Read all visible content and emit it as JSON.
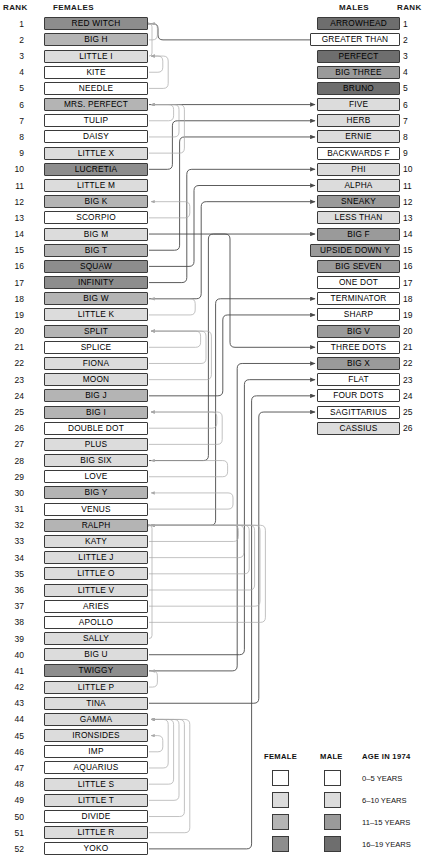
{
  "headers": {
    "rank_left": "RANK",
    "females": "FEMALES",
    "males": "MALES",
    "rank_right": "RANK"
  },
  "females": [
    {
      "rank": 1,
      "name": "RED WITCH",
      "age_class": 3
    },
    {
      "rank": 2,
      "name": "BIG H",
      "age_class": 2
    },
    {
      "rank": 3,
      "name": "LITTLE I",
      "age_class": 1
    },
    {
      "rank": 4,
      "name": "KITE",
      "age_class": 0
    },
    {
      "rank": 5,
      "name": "NEEDLE",
      "age_class": 0
    },
    {
      "rank": 6,
      "name": "MRS. PERFECT",
      "age_class": 2
    },
    {
      "rank": 7,
      "name": "TULIP",
      "age_class": 0
    },
    {
      "rank": 8,
      "name": "DAISY",
      "age_class": 0
    },
    {
      "rank": 9,
      "name": "LITTLE X",
      "age_class": 1
    },
    {
      "rank": 10,
      "name": "LUCRETIA",
      "age_class": 3
    },
    {
      "rank": 11,
      "name": "LITTLE M",
      "age_class": 1
    },
    {
      "rank": 12,
      "name": "BIG K",
      "age_class": 2
    },
    {
      "rank": 13,
      "name": "SCORPIO",
      "age_class": 0
    },
    {
      "rank": 14,
      "name": "BIG M",
      "age_class": 1
    },
    {
      "rank": 15,
      "name": "BIG T",
      "age_class": 2
    },
    {
      "rank": 16,
      "name": "SQUAW",
      "age_class": 3
    },
    {
      "rank": 17,
      "name": "INFINITY",
      "age_class": 3
    },
    {
      "rank": 18,
      "name": "BIG W",
      "age_class": 2
    },
    {
      "rank": 19,
      "name": "LITTLE K",
      "age_class": 1
    },
    {
      "rank": 20,
      "name": "SPLIT",
      "age_class": 2
    },
    {
      "rank": 21,
      "name": "SPLICE",
      "age_class": 0
    },
    {
      "rank": 22,
      "name": "FIONA",
      "age_class": 1
    },
    {
      "rank": 23,
      "name": "MOON",
      "age_class": 1
    },
    {
      "rank": 24,
      "name": "BIG J",
      "age_class": 2
    },
    {
      "rank": 25,
      "name": "BIG I",
      "age_class": 2
    },
    {
      "rank": 26,
      "name": "DOUBLE DOT",
      "age_class": 0
    },
    {
      "rank": 27,
      "name": "PLUS",
      "age_class": 1
    },
    {
      "rank": 28,
      "name": "BIG SIX",
      "age_class": 1
    },
    {
      "rank": 29,
      "name": "LOVE",
      "age_class": 0
    },
    {
      "rank": 30,
      "name": "BIG Y",
      "age_class": 2
    },
    {
      "rank": 31,
      "name": "VENUS",
      "age_class": 0
    },
    {
      "rank": 32,
      "name": "RALPH",
      "age_class": 2
    },
    {
      "rank": 33,
      "name": "KATY",
      "age_class": 1
    },
    {
      "rank": 34,
      "name": "LITTLE J",
      "age_class": 1
    },
    {
      "rank": 35,
      "name": "LITTLE O",
      "age_class": 1
    },
    {
      "rank": 36,
      "name": "LITTLE V",
      "age_class": 1
    },
    {
      "rank": 37,
      "name": "ARIES",
      "age_class": 0
    },
    {
      "rank": 38,
      "name": "APOLLO",
      "age_class": 0
    },
    {
      "rank": 39,
      "name": "SALLY",
      "age_class": 1
    },
    {
      "rank": 40,
      "name": "BIG U",
      "age_class": 1
    },
    {
      "rank": 41,
      "name": "TWIGGY",
      "age_class": 3
    },
    {
      "rank": 42,
      "name": "LITTLE P",
      "age_class": 1
    },
    {
      "rank": 43,
      "name": "TINA",
      "age_class": 1
    },
    {
      "rank": 44,
      "name": "GAMMA",
      "age_class": 1
    },
    {
      "rank": 45,
      "name": "IRONSIDES",
      "age_class": 1
    },
    {
      "rank": 46,
      "name": "IMP",
      "age_class": 0
    },
    {
      "rank": 47,
      "name": "AQUARIUS",
      "age_class": 0
    },
    {
      "rank": 48,
      "name": "LITTLE S",
      "age_class": 1
    },
    {
      "rank": 49,
      "name": "LITTLE T",
      "age_class": 1
    },
    {
      "rank": 50,
      "name": "DIVIDE",
      "age_class": 0
    },
    {
      "rank": 51,
      "name": "LITTLE R",
      "age_class": 1
    },
    {
      "rank": 52,
      "name": "YOKO",
      "age_class": 0
    }
  ],
  "males": [
    {
      "rank": 1,
      "name": "ARROWHEAD",
      "age_class": 3
    },
    {
      "rank": 2,
      "name": "GREATER THAN",
      "age_class": 0
    },
    {
      "rank": 3,
      "name": "PERFECT",
      "age_class": 3
    },
    {
      "rank": 4,
      "name": "BIG THREE",
      "age_class": 2
    },
    {
      "rank": 5,
      "name": "BRUNO",
      "age_class": 3
    },
    {
      "rank": 6,
      "name": "FIVE",
      "age_class": 1
    },
    {
      "rank": 7,
      "name": "HERB",
      "age_class": 1
    },
    {
      "rank": 8,
      "name": "ERNIE",
      "age_class": 1
    },
    {
      "rank": 9,
      "name": "BACKWARDS F",
      "age_class": 0
    },
    {
      "rank": 10,
      "name": "PHI",
      "age_class": 1
    },
    {
      "rank": 11,
      "name": "ALPHA",
      "age_class": 1
    },
    {
      "rank": 12,
      "name": "SNEAKY",
      "age_class": 2
    },
    {
      "rank": 13,
      "name": "LESS THAN",
      "age_class": 1
    },
    {
      "rank": 14,
      "name": "BIG F",
      "age_class": 2
    },
    {
      "rank": 15,
      "name": "UPSIDE DOWN Y",
      "age_class": 2
    },
    {
      "rank": 16,
      "name": "BIG SEVEN",
      "age_class": 2
    },
    {
      "rank": 17,
      "name": "ONE DOT",
      "age_class": 0
    },
    {
      "rank": 18,
      "name": "TERMINATOR",
      "age_class": 0
    },
    {
      "rank": 19,
      "name": "SHARP",
      "age_class": 0
    },
    {
      "rank": 20,
      "name": "BIG V",
      "age_class": 2
    },
    {
      "rank": 21,
      "name": "THREE DOTS",
      "age_class": 0
    },
    {
      "rank": 22,
      "name": "BIG X",
      "age_class": 2
    },
    {
      "rank": 23,
      "name": "FLAT",
      "age_class": 0
    },
    {
      "rank": 24,
      "name": "FOUR DOTS",
      "age_class": 0
    },
    {
      "rank": 25,
      "name": "SAGITTARIUS",
      "age_class": 0
    },
    {
      "rank": 26,
      "name": "CASSIUS",
      "age_class": 1
    }
  ],
  "legend": {
    "female_header": "FEMALE",
    "male_header": "MALE",
    "age_header": "AGE IN 1974",
    "rows": [
      {
        "label": "0–5 YEARS",
        "female_color": "#ffffff",
        "male_color": "#ffffff"
      },
      {
        "label": "6–10 YEARS",
        "female_color": "#dcdcdc",
        "male_color": "#dcdcdc"
      },
      {
        "label": "11–15 YEARS",
        "female_color": "#b4b4b4",
        "male_color": "#9a9a9a"
      },
      {
        "label": "16–19 YEARS",
        "female_color": "#8d8d8d",
        "male_color": "#6e6e6e"
      }
    ]
  },
  "colors": {
    "female_swatches": [
      "#ffffff",
      "#dcdcdc",
      "#b4b4b4",
      "#8d8d8d"
    ],
    "male_swatches": [
      "#ffffff",
      "#dcdcdc",
      "#9a9a9a",
      "#6e6e6e"
    ],
    "box_border": "#3a3a3a",
    "link_dark": "#4a4a4a",
    "link_light": "#a8a8a8"
  },
  "links": [
    {
      "from": 1,
      "to": 2,
      "tone": "dark"
    },
    {
      "from": 6,
      "to": 6,
      "tone": "dark"
    },
    {
      "from": 10,
      "to": 7,
      "tone": "dark"
    },
    {
      "from": 15,
      "to": 8,
      "tone": "dark"
    },
    {
      "from": 17,
      "to": 10,
      "tone": "dark"
    },
    {
      "from": 16,
      "to": 11,
      "tone": "dark"
    },
    {
      "from": 18,
      "to": 12,
      "tone": "dark"
    },
    {
      "from": 28,
      "to": 14,
      "tone": "dark"
    },
    {
      "from": 32,
      "to": 18,
      "tone": "dark"
    },
    {
      "from": 24,
      "to": 19,
      "tone": "dark"
    },
    {
      "from": 14,
      "to": 21,
      "tone": "dark"
    },
    {
      "from": 41,
      "to": 22,
      "tone": "dark"
    },
    {
      "from": 40,
      "to": 23,
      "tone": "dark"
    },
    {
      "from": 52,
      "to": 24,
      "tone": "dark"
    },
    {
      "from": 43,
      "to": 25,
      "tone": "dark"
    },
    {
      "from": 3,
      "to": 1,
      "tone": "light"
    },
    {
      "from": 2,
      "to": 1,
      "tone": "light"
    },
    {
      "from": 4,
      "to": 3,
      "tone": "light"
    },
    {
      "from": 5,
      "to": 3,
      "tone": "light"
    },
    {
      "from": 7,
      "to": 6,
      "tone": "light"
    },
    {
      "from": 8,
      "to": 6,
      "tone": "light"
    },
    {
      "from": 9,
      "to": 6,
      "tone": "light"
    },
    {
      "from": 13,
      "to": 12,
      "tone": "light"
    },
    {
      "from": 19,
      "to": 18,
      "tone": "light"
    },
    {
      "from": 21,
      "to": 20,
      "tone": "light"
    },
    {
      "from": 22,
      "to": 20,
      "tone": "light"
    },
    {
      "from": 23,
      "to": 20,
      "tone": "light"
    },
    {
      "from": 26,
      "to": 25,
      "tone": "light"
    },
    {
      "from": 27,
      "to": 25,
      "tone": "light"
    },
    {
      "from": 29,
      "to": 28,
      "tone": "light"
    },
    {
      "from": 31,
      "to": 30,
      "tone": "light"
    },
    {
      "from": 33,
      "to": 32,
      "tone": "light"
    },
    {
      "from": 34,
      "to": 32,
      "tone": "light"
    },
    {
      "from": 35,
      "to": 32,
      "tone": "light"
    },
    {
      "from": 36,
      "to": 32,
      "tone": "light"
    },
    {
      "from": 37,
      "to": 32,
      "tone": "light"
    },
    {
      "from": 38,
      "to": 32,
      "tone": "light"
    },
    {
      "from": 39,
      "to": 32,
      "tone": "light"
    },
    {
      "from": 42,
      "to": 41,
      "tone": "light"
    },
    {
      "from": 46,
      "to": 45,
      "tone": "light"
    },
    {
      "from": 47,
      "to": 44,
      "tone": "light"
    },
    {
      "from": 48,
      "to": 44,
      "tone": "light"
    },
    {
      "from": 49,
      "to": 44,
      "tone": "light"
    },
    {
      "from": 50,
      "to": 44,
      "tone": "light"
    },
    {
      "from": 51,
      "to": 44,
      "tone": "light"
    }
  ]
}
